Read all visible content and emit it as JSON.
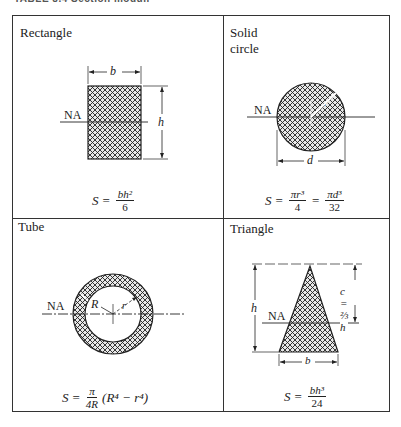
{
  "caption": "TABLE 8.4  Section moduli",
  "cells": {
    "rectangle": {
      "title": "Rectangle",
      "dim_b": "b",
      "dim_h": "h",
      "axis": "NA",
      "formula": {
        "lhs": "S",
        "eq": "=",
        "num": "bh²",
        "den": "6"
      }
    },
    "solid_circle": {
      "title": "Solid circle",
      "dim_d": "d",
      "dim_r": "r",
      "axis": "NA",
      "formula": {
        "lhs": "S",
        "eq": "=",
        "num1": "πr³",
        "den1": "4",
        "eq2": "=",
        "num2": "πd³",
        "den2": "32"
      }
    },
    "tube": {
      "title": "Tube",
      "dim_R": "R",
      "dim_r": "r",
      "axis": "NA",
      "formula": {
        "lhs": "S",
        "eq": "=",
        "num": "π",
        "den": "4R",
        "rest": "(R⁴ − r⁴)"
      }
    },
    "triangle": {
      "title": "Triangle",
      "dim_h": "h",
      "dim_b": "b",
      "dim_c": "c = ⅔ h",
      "axis": "NA",
      "formula": {
        "lhs": "S",
        "eq": "=",
        "num": "bh³",
        "den": "24"
      }
    }
  }
}
